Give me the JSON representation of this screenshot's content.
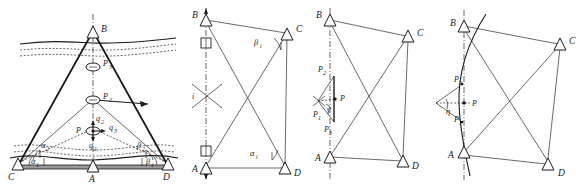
{
  "figure": {
    "panel_count": 4,
    "ink_color": "#1b1b1b",
    "background_color": "#ffffff"
  },
  "panel1": {
    "name": "deformation-monitoring-section",
    "stations": [
      {
        "id": "B",
        "label": "B",
        "x": 93,
        "y": 31,
        "type": "triangle"
      },
      {
        "id": "C",
        "label": "C",
        "x": 18,
        "y": 165,
        "type": "triangle"
      },
      {
        "id": "A",
        "label": "A",
        "x": 93,
        "y": 165,
        "type": "triangle"
      },
      {
        "id": "D",
        "label": "D",
        "x": 168,
        "y": 165,
        "type": "triangle"
      }
    ],
    "targets": [
      {
        "id": "P3",
        "label": "P",
        "sub": "3",
        "x": 93,
        "y": 67,
        "type": "ellipse"
      },
      {
        "id": "P2",
        "label": "P",
        "sub": "2",
        "x": 93,
        "y": 100,
        "type": "ellipse"
      },
      {
        "id": "P",
        "label": "P",
        "sub": "",
        "x": 93,
        "y": 131,
        "type": "ellipse"
      }
    ],
    "displacement_vectors": [
      {
        "label": "q",
        "sub": "2",
        "direction": "up"
      },
      {
        "label": "q",
        "sub": "3",
        "direction": "right"
      },
      {
        "label": "q",
        "sub": "1",
        "direction": "down"
      }
    ],
    "angles": [
      {
        "label": "α",
        "sub": "2",
        "x": 44,
        "y": 145
      },
      {
        "label": "α",
        "sub": "1",
        "x": 34,
        "y": 160
      },
      {
        "label": "β",
        "sub": "2",
        "x": 140,
        "y": 145
      },
      {
        "label": "β",
        "sub": "1",
        "x": 148,
        "y": 160
      }
    ],
    "features": [
      "water-surface-wavy-lines",
      "dashed-strata-lines",
      "ground-baseline",
      "horizontal-arrow"
    ]
  },
  "panel2": {
    "name": "intersection-angle-network",
    "stations": [
      {
        "id": "B",
        "label": "B",
        "x": 18,
        "y": 20,
        "type": "triangle"
      },
      {
        "id": "C",
        "label": "C",
        "x": 102,
        "y": 33,
        "type": "triangle"
      },
      {
        "id": "A",
        "label": "A",
        "x": 18,
        "y": 168,
        "type": "triangle"
      },
      {
        "id": "D",
        "label": "D",
        "x": 100,
        "y": 168,
        "type": "triangle"
      }
    ],
    "intersection": {
      "id": "i",
      "label": "i",
      "x": 20,
      "y": 95
    },
    "angles": [
      {
        "label": "β",
        "sub": "i",
        "x": 68,
        "y": 42
      },
      {
        "label": "α",
        "sub": "i",
        "x": 66,
        "y": 152
      }
    ],
    "markers": [
      "square-target-upper",
      "square-target-lower"
    ],
    "axis": "vertical-dash-dot-centerline"
  },
  "panel3": {
    "name": "displacement-vector-network",
    "stations": [
      {
        "id": "B",
        "label": "B",
        "x": 16,
        "y": 20,
        "type": "triangle"
      },
      {
        "id": "C",
        "label": "C",
        "x": 96,
        "y": 36,
        "type": "triangle"
      },
      {
        "id": "A",
        "label": "A",
        "x": 16,
        "y": 157,
        "type": "triangle"
      },
      {
        "id": "D",
        "label": "D",
        "x": 92,
        "y": 161,
        "type": "triangle"
      }
    ],
    "points": [
      {
        "id": "P2",
        "label": "P",
        "sub": "2",
        "x": 16,
        "y": 76
      },
      {
        "id": "P1",
        "label": "P",
        "sub": "1",
        "x": 2,
        "y": 106
      },
      {
        "id": "P3",
        "label": "P",
        "sub": "3",
        "x": 14,
        "y": 118
      },
      {
        "id": "P",
        "label": "P",
        "sub": "",
        "x": 28,
        "y": 98
      }
    ],
    "angles": [
      {
        "label": "γ",
        "sub": "",
        "x": 18,
        "y": 105
      }
    ],
    "axis": "vertical-dash-dot-centerline"
  },
  "panel4": {
    "name": "curved-trajectory-network",
    "stations": [
      {
        "id": "B",
        "label": "B",
        "x": 29,
        "y": 24,
        "type": "triangle"
      },
      {
        "id": "C",
        "label": "C",
        "x": 128,
        "y": 42,
        "type": "triangle"
      },
      {
        "id": "A",
        "label": "A",
        "x": 28,
        "y": 152,
        "type": "triangle"
      },
      {
        "id": "D",
        "label": "D",
        "x": 116,
        "y": 164,
        "type": "triangle"
      }
    ],
    "points": [
      {
        "id": "P2",
        "label": "P",
        "sub": "2",
        "x": 26,
        "y": 82
      },
      {
        "id": "P",
        "label": "P",
        "sub": "",
        "x": 38,
        "y": 103
      },
      {
        "id": "P1",
        "label": "P",
        "sub": "1",
        "x": 26,
        "y": 122
      }
    ],
    "angles": [
      {
        "label": "η",
        "sub": "",
        "x": 14,
        "y": 108
      }
    ],
    "features": [
      "curved-arc-through-points",
      "vertical-dash-dot-centerline"
    ]
  }
}
